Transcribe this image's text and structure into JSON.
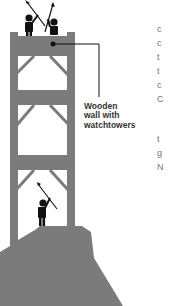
{
  "diagram": {
    "callout_label": [
      "Wooden",
      "wall with",
      "watchtowers"
    ],
    "colors": {
      "wall": "#7b7b7b",
      "figure": "#111111",
      "line": "#111111",
      "text": "#333333"
    }
  },
  "cutoff_text": {
    "column_top": [
      "c",
      "c",
      "t",
      "t",
      "c",
      "C"
    ],
    "column_bottom": [
      "t",
      "g",
      "N"
    ]
  }
}
